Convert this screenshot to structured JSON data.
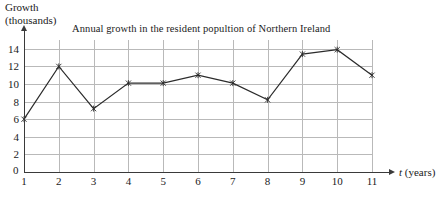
{
  "chart_data": {
    "type": "line",
    "title": "Annual growth in the resident popultion of Northern Ireland",
    "xlabel": "t (years)",
    "ylabel": "Growth (thousands)",
    "ylabel_line1": "Growth",
    "ylabel_line2": "(thousands)",
    "x": [
      1,
      2,
      3,
      4,
      5,
      6,
      7,
      8,
      9,
      10,
      11
    ],
    "values": [
      6,
      12,
      7.2,
      10.1,
      10.1,
      11,
      10.1,
      8.2,
      13.4,
      13.9,
      11
    ],
    "xlim": [
      1,
      11
    ],
    "ylim": [
      0,
      15
    ],
    "xticks": [
      "1",
      "2",
      "3",
      "4",
      "5",
      "6",
      "7",
      "8",
      "9",
      "10",
      "11"
    ],
    "yticks": [
      "2",
      "4",
      "6",
      "8",
      "10",
      "12",
      "14"
    ],
    "ytick_values": [
      2,
      4,
      6,
      8,
      10,
      12,
      14
    ],
    "origin_label": "0",
    "grid": true,
    "legend": "none",
    "marker": "cross",
    "line_color": "#2b2b2b",
    "grid_color": "#b9b9b9",
    "axis_color": "#3a3a3a",
    "background": "#ffffff"
  }
}
